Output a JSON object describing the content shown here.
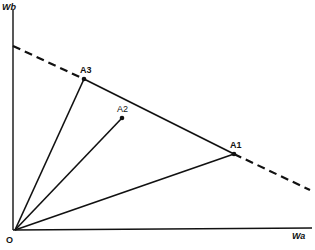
{
  "axes": {
    "y_label": "Wb",
    "x_label": "Wa",
    "origin_label": "O"
  },
  "points": [
    {
      "label": "A1",
      "x": 234,
      "y": 154
    },
    {
      "label": "A2",
      "x": 122,
      "y": 118
    },
    {
      "label": "A3",
      "x": 84,
      "y": 79
    }
  ],
  "lines": {
    "budget_line": "dashed line through A3 and A1",
    "solid_segment": "A3 to A1"
  },
  "colors": {
    "ink": "#111111",
    "background": "#ffffff"
  }
}
